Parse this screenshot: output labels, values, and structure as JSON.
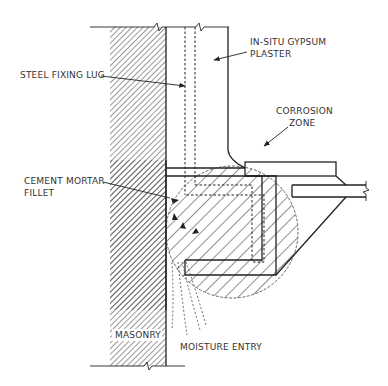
{
  "diagram": {
    "title": "",
    "type": "construction-detail-section",
    "labels": {
      "steel_fixing_lug": "STEEL FIXING LUG",
      "in_situ_gypsum_plaster_line1": "IN-SITU GYPSUM",
      "in_situ_gypsum_plaster_line2": "PLASTER",
      "corrosion_zone_line1": "CORROSION",
      "corrosion_zone_line2": "ZONE",
      "cement_mortar_fillet_line1": "CEMENT MORTAR",
      "cement_mortar_fillet_line2": "FILLET",
      "masonry": "MASONRY",
      "moisture_entry": "MOISTURE ENTRY"
    },
    "components": [
      {
        "name": "masonry",
        "hatch": "fine-diagonal"
      },
      {
        "name": "in-situ gypsum plaster"
      },
      {
        "name": "steel fixing lug",
        "style": "dashed"
      },
      {
        "name": "cement mortar fillet"
      },
      {
        "name": "corrosion zone",
        "shape": "circle",
        "hatch": "diagonal"
      },
      {
        "name": "moisture entry",
        "style": "dotted-lines"
      }
    ],
    "colors": {
      "line": "#222222",
      "text": "#333333",
      "background": "#ffffff"
    }
  }
}
